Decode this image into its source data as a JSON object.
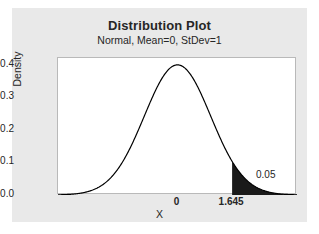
{
  "chart_data": {
    "type": "line",
    "title": "Distribution Plot",
    "subtitle": "Normal, Mean=0, StDev=1",
    "xlabel": "X",
    "ylabel": "Density",
    "distribution": "Normal",
    "mean": 0,
    "stdev": 1,
    "xlim": [
      -3.6,
      3.6
    ],
    "ylim": [
      0.0,
      0.42
    ],
    "grid": false,
    "legend": null,
    "y_ticks": [
      "0.0",
      "0.1",
      "0.2",
      "0.3",
      "0.4"
    ],
    "y_tick_values": [
      0.0,
      0.1,
      0.2,
      0.3,
      0.4
    ],
    "x_ticks": [
      "0",
      "1.645"
    ],
    "x_tick_values": [
      0,
      1.645
    ],
    "peak_density": 0.399,
    "shaded_region": {
      "label": "0.05",
      "area": 0.05,
      "from": 1.645,
      "to": 3.6,
      "color": "#1a1a1a",
      "side": "right-tail"
    },
    "series": [
      {
        "name": "Normal PDF",
        "color": "#000000",
        "x": [
          -3.6,
          -3.4,
          -3.2,
          -3.0,
          -2.8,
          -2.6,
          -2.4,
          -2.2,
          -2.0,
          -1.8,
          -1.6,
          -1.4,
          -1.2,
          -1.0,
          -0.8,
          -0.6,
          -0.4,
          -0.2,
          0.0,
          0.2,
          0.4,
          0.6,
          0.8,
          1.0,
          1.2,
          1.4,
          1.645,
          1.8,
          2.0,
          2.2,
          2.4,
          2.6,
          2.8,
          3.0,
          3.2,
          3.4,
          3.6
        ],
        "values": [
          0.0006,
          0.0012,
          0.0024,
          0.0044,
          0.0079,
          0.0136,
          0.0224,
          0.0355,
          0.054,
          0.079,
          0.1109,
          0.1497,
          0.1942,
          0.242,
          0.2897,
          0.3332,
          0.3683,
          0.391,
          0.3989,
          0.391,
          0.3683,
          0.3332,
          0.2897,
          0.242,
          0.1942,
          0.1497,
          0.1031,
          0.079,
          0.054,
          0.0355,
          0.0224,
          0.0136,
          0.0079,
          0.0044,
          0.0024,
          0.0012,
          0.0006
        ]
      }
    ]
  },
  "figure": {
    "title": "Distribution Plot",
    "subtitle": "Normal, Mean=0, StDev=1",
    "y_axis_label": "Density",
    "x_axis_label": "X",
    "y_ticks": [
      "0.4",
      "0.3",
      "0.2",
      "0.1",
      "0.0"
    ],
    "x_ticks": [
      "0",
      "1.645"
    ],
    "annotation": "0.05",
    "panel_color": "#e9e9e9",
    "plot_background": "#ffffff",
    "curve_color": "#000000",
    "shade_color": "#1a1a1a"
  }
}
